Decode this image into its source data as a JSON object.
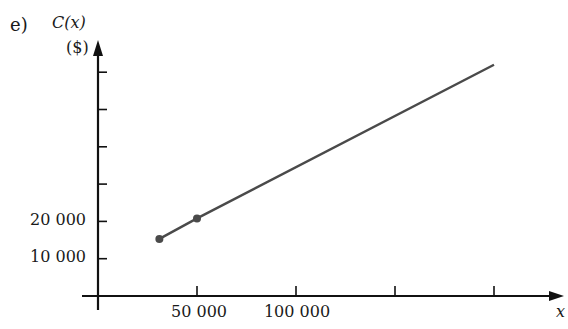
{
  "part_label": "e)",
  "top_text": "",
  "chart_data": {
    "type": "line",
    "title": "",
    "xlabel": "x",
    "ylabel": "C(x)",
    "ylabel_unit": "($)",
    "x_tick_labels": [
      "50 000",
      "100 000"
    ],
    "x_ticks": [
      50000,
      100000,
      150000,
      200000
    ],
    "y_tick_labels": [
      "20 000",
      "10 000"
    ],
    "y_ticks": [
      10000,
      20000,
      30000,
      40000,
      50000,
      60000
    ],
    "xlim": [
      0,
      210000
    ],
    "ylim": [
      0,
      65000
    ],
    "grid": false,
    "series": [
      {
        "name": "C(x)",
        "x": [
          31000,
          50000,
          200000
        ],
        "y": [
          15300,
          20800,
          62000
        ],
        "markers": [
          [
            31000,
            15300
          ],
          [
            50000,
            20800
          ]
        ]
      }
    ],
    "line_color": "#4a4a4a"
  },
  "labels": {
    "tick_10000": "10 000",
    "tick_20000": "20 000",
    "tick_50000": "50 000",
    "tick_100000": "100 000"
  }
}
